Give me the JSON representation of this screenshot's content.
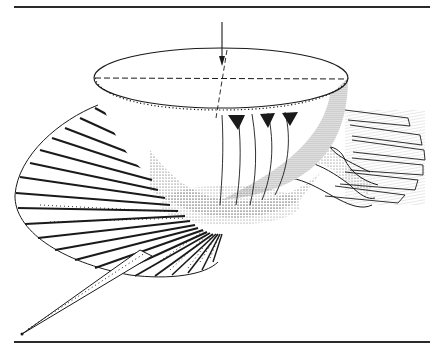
{
  "figure": {
    "kind": "scientific line-and-stipple illustration",
    "colors": {
      "ink": "#1a1a1a",
      "rule": "#2a2a2a",
      "background": "#ffffff"
    },
    "elements": {
      "arrow": "downward-arrow",
      "dome": "hemisphere-with-dashed-diameter",
      "fan": "radial-ribbon-strips",
      "long_strip": "tapering-strip-lower-left"
    }
  }
}
